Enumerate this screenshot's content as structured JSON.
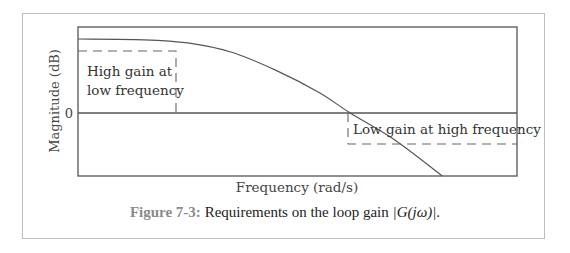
{
  "chart_data": {
    "type": "line",
    "title": "",
    "xlabel": "Frequency (rad/s)",
    "ylabel": "Magnitude (dB)",
    "x_scale": "log (unlabeled)",
    "ylim": [
      -1,
      1
    ],
    "y_ticks": [
      {
        "value": 0,
        "label": "0"
      }
    ],
    "grid": false,
    "series": [
      {
        "name": "|G(jω)|",
        "description": "Low-pass loop gain: flat high gain at low frequency, rolls off, crosses 0 dB, continues falling",
        "points": [
          [
            0.0,
            0.95
          ],
          [
            0.15,
            0.94
          ],
          [
            0.25,
            0.9
          ],
          [
            0.35,
            0.78
          ],
          [
            0.45,
            0.55
          ],
          [
            0.55,
            0.26
          ],
          [
            0.62,
            0.0
          ],
          [
            0.72,
            -0.42
          ],
          [
            0.83,
            -1.0
          ]
        ]
      }
    ],
    "annotations": [
      {
        "text": "High gain at",
        "line": 1,
        "region": "low frequency, above dashed bound"
      },
      {
        "text": "low frequency",
        "line": 2,
        "region": "low frequency, above dashed bound"
      },
      {
        "text": "Low gain at high frequency",
        "region": "high frequency, below dashed bound"
      }
    ],
    "bounds": [
      {
        "name": "low-frequency lower bound",
        "style": "dashed",
        "x_range": [
          0.0,
          0.22
        ],
        "y": 0.74
      },
      {
        "name": "high-frequency upper bound",
        "style": "dashed",
        "x_range": [
          0.66,
          1.0
        ],
        "y": -0.5
      }
    ],
    "zero_line": 0
  },
  "labels": {
    "y_axis": "Magnitude (dB)",
    "x_axis": "Frequency (rad/s)",
    "zero_tick": "0",
    "low_freq_line1": "High gain at",
    "low_freq_line2": "low frequency",
    "high_freq": "Low gain at high frequency"
  },
  "caption": {
    "figure_label": "Figure 7-3:",
    "text": " Requirements on the loop gain ",
    "math": "|G(jω)|",
    "end": "."
  },
  "colors": {
    "axes": "#555555",
    "curve": "#555555",
    "dashed": "#666666",
    "text": "#333333",
    "figure_label": "#8a8a8a",
    "frame": "#bdbdbd"
  }
}
